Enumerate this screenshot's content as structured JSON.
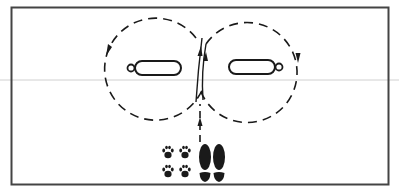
{
  "diagram": {
    "description": "Figure-eight pattern around two obstacles with handler and dog starting position",
    "colors": {
      "line": "#1a1a1a",
      "frame": "#444444",
      "scan_line": "#d0d0d0",
      "background": "#ffffff"
    },
    "frame": {
      "x": 11,
      "y": 7,
      "width": 378,
      "height": 178
    },
    "obstacles": [
      {
        "name": "left-obstacle",
        "x": 135,
        "y": 61,
        "width": 46,
        "height": 14,
        "loop_side": "left",
        "loop_cx": 131,
        "loop_cy": 68
      },
      {
        "name": "right-obstacle",
        "x": 229,
        "y": 60,
        "width": 46,
        "height": 14,
        "loop_side": "right",
        "loop_cx": 279,
        "loop_cy": 67
      }
    ],
    "paths": {
      "left_loop": {
        "cx": 155,
        "cy": 67,
        "r": 51,
        "direction": "counter-clockwise"
      },
      "right_loop": {
        "cx": 251,
        "cy": 67,
        "r": 50,
        "direction": "clockwise"
      },
      "approach": {
        "x": 200,
        "y_start": 142,
        "y_end": 100
      }
    },
    "start_position": {
      "dog_paw_prints": 4,
      "handler_shoe_prints": 2
    }
  }
}
